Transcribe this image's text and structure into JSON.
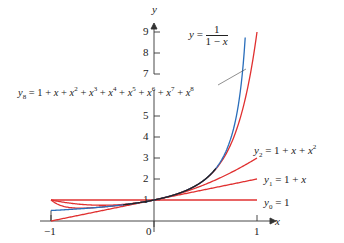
{
  "chart_data": {
    "type": "line",
    "title": "",
    "xlabel": "x",
    "ylabel": "y",
    "xlim": [
      -1,
      1
    ],
    "ylim": [
      0,
      9
    ],
    "x_ticks": [
      "-1",
      "0",
      "1"
    ],
    "y_ticks": [
      "1",
      "2",
      "3",
      "4",
      "5",
      "7",
      "8",
      "9"
    ],
    "grid": false,
    "series": [
      {
        "name": "y = 1/(1 - x)",
        "color": "#2a6ebb",
        "formula": "1/(1-x)",
        "x": [
          -1,
          -0.5,
          0,
          0.5,
          0.75,
          0.889
        ],
        "y": [
          0.5,
          0.667,
          1,
          2,
          4,
          9
        ]
      },
      {
        "name": "y8 = 1 + x + x^2 + x^3 + x^4 + x^5 + x^6 + x^7 + x^8",
        "color": "#e03030",
        "formula": "sum x^k, k=0..8",
        "x": [
          -1,
          -0.5,
          0,
          0.5,
          0.75,
          1
        ],
        "y": [
          1,
          0.668,
          1,
          1.996,
          3.7,
          9
        ]
      },
      {
        "name": "y2 = 1 + x + x^2",
        "color": "#e03030",
        "formula": "1+x+x^2",
        "x": [
          -1,
          -0.5,
          0,
          0.5,
          1
        ],
        "y": [
          1,
          0.75,
          1,
          1.75,
          3
        ]
      },
      {
        "name": "y1 = 1 + x",
        "color": "#e03030",
        "formula": "1+x",
        "x": [
          -1,
          0,
          1
        ],
        "y": [
          0,
          1,
          2
        ]
      },
      {
        "name": "y0 = 1",
        "color": "#e03030",
        "formula": "1",
        "x": [
          -1,
          0,
          1
        ],
        "y": [
          1,
          1,
          1
        ]
      }
    ],
    "annotations": [
      "y = 1/(1 - x)",
      "y8 = 1 + x + x^2 + x^3 + x^4 + x^5 + x^6 + x^7 + x^8",
      "y2 = 1 + x + x^2",
      "y1 = 1 + x",
      "y0 = 1"
    ]
  },
  "labels": {
    "y_axis": "y",
    "x_axis": "x",
    "tick_x_neg1": "−1",
    "tick_x_0": "0",
    "tick_x_1": "1",
    "tick_y": [
      "1",
      "2",
      "3",
      "4",
      "5",
      "7",
      "8",
      "9"
    ]
  },
  "colors": {
    "blue": "#2a6ebb",
    "red": "#e03030",
    "axis": "#333333"
  }
}
